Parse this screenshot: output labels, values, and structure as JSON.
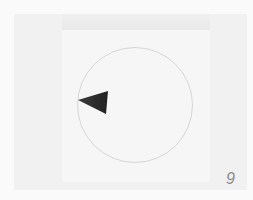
{
  "figure": {
    "panel_number": "9",
    "colors": {
      "background": "#fafafa",
      "frame": "#f1f1f1",
      "circle_outline": "#d6d6d6",
      "marker": "#2a2a2a",
      "label": "#8a8a8a"
    }
  }
}
